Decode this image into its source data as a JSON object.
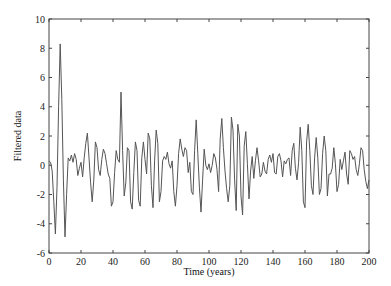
{
  "chart_data": {
    "type": "line",
    "title": "",
    "xlabel": "Time (years)",
    "ylabel": "Filtered data",
    "xlim": [
      0,
      200
    ],
    "ylim": [
      -6,
      10
    ],
    "xticks": [
      0,
      20,
      40,
      60,
      80,
      100,
      120,
      140,
      160,
      180,
      200
    ],
    "yticks": [
      -6,
      -4,
      -2,
      0,
      2,
      4,
      6,
      8,
      10
    ],
    "grid": false,
    "legend": null,
    "line_color": "#555555",
    "series": [
      {
        "name": "Filtered data",
        "x": [
          0,
          1,
          2,
          3,
          4,
          5,
          6,
          7,
          8,
          9,
          10,
          11,
          12,
          13,
          14,
          15,
          16,
          17,
          18,
          19,
          20,
          21,
          22,
          23,
          24,
          25,
          26,
          27,
          28,
          29,
          30,
          31,
          32,
          33,
          34,
          35,
          36,
          37,
          38,
          39,
          40,
          41,
          42,
          43,
          44,
          45,
          46,
          47,
          48,
          49,
          50,
          51,
          52,
          53,
          54,
          55,
          56,
          57,
          58,
          59,
          60,
          61,
          62,
          63,
          64,
          65,
          66,
          67,
          68,
          69,
          70,
          71,
          72,
          73,
          74,
          75,
          76,
          77,
          78,
          79,
          80,
          81,
          82,
          83,
          84,
          85,
          86,
          87,
          88,
          89,
          90,
          91,
          92,
          93,
          94,
          95,
          96,
          97,
          98,
          99,
          100,
          101,
          102,
          103,
          104,
          105,
          106,
          107,
          108,
          109,
          110,
          111,
          112,
          113,
          114,
          115,
          116,
          117,
          118,
          119,
          120,
          121,
          122,
          123,
          124,
          125,
          126,
          127,
          128,
          129,
          130,
          131,
          132,
          133,
          134,
          135,
          136,
          137,
          138,
          139,
          140,
          141,
          142,
          143,
          144,
          145,
          146,
          147,
          148,
          149,
          150,
          151,
          152,
          153,
          154,
          155,
          156,
          157,
          158,
          159,
          160,
          161,
          162,
          163,
          164,
          165,
          166,
          167,
          168,
          169,
          170,
          171,
          172,
          173,
          174,
          175,
          176,
          177,
          178,
          179,
          180,
          181,
          182,
          183,
          184,
          185,
          186,
          187,
          188,
          189,
          190,
          191,
          192,
          193,
          194,
          195,
          196,
          197,
          198,
          199,
          200
        ],
        "y": [
          0.3,
          0.2,
          -0.4,
          -2.5,
          -4.7,
          -1.5,
          4.0,
          8.3,
          4.5,
          -1.0,
          -4.9,
          -2.0,
          0.5,
          0.3,
          0.7,
          0.2,
          0.8,
          0.4,
          -0.7,
          -0.2,
          0.2,
          -0.8,
          0.5,
          1.5,
          2.2,
          0.5,
          -1.2,
          -2.5,
          -1.0,
          1.6,
          1.2,
          -0.3,
          -0.7,
          0.4,
          1.1,
          0.8,
          0.1,
          -0.6,
          -0.9,
          -2.8,
          -2.5,
          -0.5,
          1.0,
          0.4,
          0.2,
          5.0,
          1.0,
          -2.1,
          -1.2,
          1.2,
          1.0,
          -2.5,
          -3.0,
          -0.5,
          1.6,
          1.0,
          -2.4,
          -2.8,
          0.5,
          1.6,
          0.4,
          -0.6,
          2.2,
          1.8,
          -1.4,
          -2.9,
          0.3,
          2.4,
          1.5,
          -2.5,
          -1.8,
          0.3,
          0.6,
          0.4,
          0.9,
          0.1,
          -0.2,
          0.3,
          -1.8,
          -2.8,
          -1.4,
          0.8,
          1.8,
          1.1,
          0.6,
          1.2,
          1.0,
          -0.5,
          0.2,
          -1.8,
          -2.0,
          1.0,
          3.1,
          0.8,
          -1.5,
          -3.2,
          -1.0,
          1.1,
          0.0,
          -0.3,
          0.1,
          -0.5,
          0.0,
          0.8,
          0.5,
          -0.3,
          -1.8,
          1.8,
          3.2,
          1.2,
          -0.4,
          -1.6,
          -2.5,
          -1.4,
          3.3,
          2.4,
          -1.0,
          -3.1,
          2.8,
          2.0,
          -2.1,
          -3.4,
          1.3,
          2.3,
          0.1,
          -2.3,
          -0.4,
          0.6,
          -0.9,
          0.3,
          1.2,
          0.3,
          -0.8,
          -0.6,
          0.2,
          -0.4,
          -0.6,
          0.4,
          0.7,
          0.2,
          0.8,
          -0.5,
          -0.6,
          0.6,
          0.8,
          0.3,
          -0.8,
          0.3,
          0.1,
          0.4,
          0.5,
          -0.7,
          1.0,
          1.5,
          -0.2,
          -1.0,
          0.2,
          2.6,
          1.0,
          -2.5,
          -2.9,
          1.6,
          2.8,
          1.0,
          -1.4,
          -2.0,
          0.5,
          1.9,
          0.5,
          -2.0,
          -1.6,
          0.8,
          2.0,
          1.0,
          -2.1,
          -0.6,
          -0.6,
          -0.2,
          1.2,
          0.1,
          -1.8,
          -1.3,
          0.4,
          -0.3,
          0.3,
          0.9,
          -0.6,
          -1.3,
          1.0,
          0.8,
          0.4,
          0.6,
          -0.3,
          -0.7,
          0.1,
          1.2,
          1.0,
          -0.3,
          -1.1,
          -1.6,
          -1.0
        ]
      }
    ]
  }
}
